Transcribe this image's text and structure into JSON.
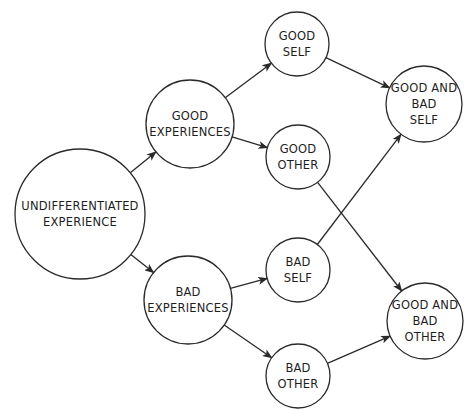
{
  "diagram": {
    "type": "flow",
    "nodes": [
      {
        "id": "undifferentiated",
        "lines": [
          "UNDIFFERENTIATED",
          "EXPERIENCE"
        ],
        "cx": 80,
        "cy": 214,
        "r": 65
      },
      {
        "id": "good_experiences",
        "lines": [
          "GOOD",
          "EXPERIENCES"
        ],
        "cx": 190,
        "cy": 124,
        "r": 44
      },
      {
        "id": "bad_experiences",
        "lines": [
          "BAD",
          "EXPERIENCES"
        ],
        "cx": 188,
        "cy": 300,
        "r": 44
      },
      {
        "id": "good_self",
        "lines": [
          "GOOD",
          "SELF"
        ],
        "cx": 297,
        "cy": 44,
        "r": 32
      },
      {
        "id": "good_other",
        "lines": [
          "GOOD",
          "OTHER"
        ],
        "cx": 298,
        "cy": 157,
        "r": 32
      },
      {
        "id": "bad_self",
        "lines": [
          "BAD",
          "SELF"
        ],
        "cx": 298,
        "cy": 270,
        "r": 32
      },
      {
        "id": "bad_other",
        "lines": [
          "BAD",
          "OTHER"
        ],
        "cx": 298,
        "cy": 376,
        "r": 32
      },
      {
        "id": "good_and_bad_self",
        "lines": [
          "GOOD AND",
          "BAD",
          "SELF"
        ],
        "cx": 424,
        "cy": 104,
        "r": 38
      },
      {
        "id": "good_and_bad_other",
        "lines": [
          "GOOD AND",
          "BAD",
          "OTHER"
        ],
        "cx": 425,
        "cy": 321,
        "r": 38
      }
    ],
    "edges": [
      {
        "from": "undifferentiated",
        "to": "good_experiences"
      },
      {
        "from": "undifferentiated",
        "to": "bad_experiences"
      },
      {
        "from": "good_experiences",
        "to": "good_self"
      },
      {
        "from": "good_experiences",
        "to": "good_other"
      },
      {
        "from": "bad_experiences",
        "to": "bad_self"
      },
      {
        "from": "bad_experiences",
        "to": "bad_other"
      },
      {
        "from": "good_self",
        "to": "good_and_bad_self"
      },
      {
        "from": "bad_self",
        "to": "good_and_bad_self"
      },
      {
        "from": "good_other",
        "to": "good_and_bad_other"
      },
      {
        "from": "bad_other",
        "to": "good_and_bad_other"
      }
    ],
    "colors": {
      "stroke": "#2a2a2a",
      "text": "#1e1e1e",
      "background": "#ffffff"
    }
  }
}
